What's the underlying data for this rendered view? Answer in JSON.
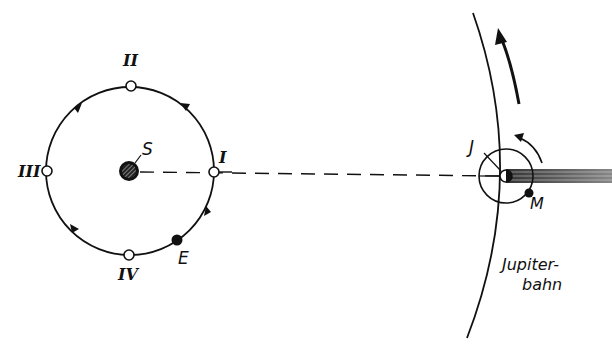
{
  "diagram": {
    "type": "astronomy-orbit-diagram",
    "colors": {
      "ink": "#111111",
      "background": "#ffffff",
      "shadow": "#555555"
    },
    "sun": {
      "label": "S",
      "cx": 130,
      "cy": 171,
      "r": 9
    },
    "earth_orbit": {
      "cx": 130,
      "cy": 171,
      "r": 85,
      "positions": [
        {
          "label": "I",
          "angle_deg": 0
        },
        {
          "label": "II",
          "angle_deg": 90
        },
        {
          "label": "III",
          "angle_deg": 180
        },
        {
          "label": "IV",
          "angle_deg": 270
        }
      ],
      "earth": {
        "label": "E"
      }
    },
    "jupiter": {
      "label": "J",
      "cx": 506,
      "cy": 176
    },
    "moon": {
      "label": "M"
    },
    "jupiter_orbit": {
      "label_line1": "Jupiter-",
      "label_line2": "bahn"
    }
  }
}
